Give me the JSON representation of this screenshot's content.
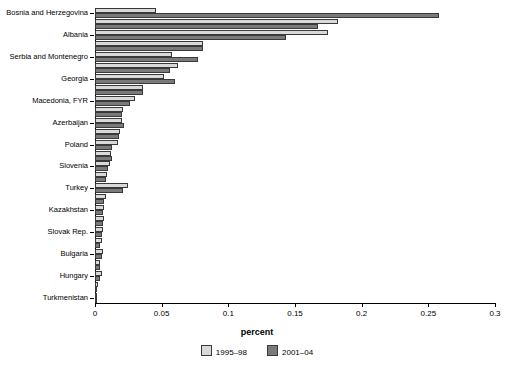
{
  "chart_data": {
    "type": "bar",
    "orientation": "horizontal",
    "title": "",
    "xlabel": "percent",
    "ylabel": "",
    "xlim": [
      0,
      0.3
    ],
    "xticks": [
      0,
      0.05,
      0.1,
      0.15,
      0.2,
      0.25,
      0.3
    ],
    "xticklabels": [
      "0",
      "0.05",
      "0.1",
      "0.15",
      "0.2",
      "0.25",
      "0.3"
    ],
    "grid": false,
    "legend_position": "bottom",
    "categories": [
      "Turkmenistan",
      "Uzbekistan",
      "Hungary",
      "Romania",
      "Bulgaria",
      "Czech Rep.",
      "Slovak Rep.",
      "Ukraine",
      "Kazakhstan",
      "Russia",
      "Turkey",
      "Croatia",
      "Slovenia",
      "Lithuania",
      "Poland",
      "Latvia",
      "Azerbaijan",
      "Estonia",
      "Macedonia, FYR",
      "Moldova",
      "Georgia",
      "Armenia",
      "Serbia and Montenegro",
      "Kyrgyz Rep.",
      "Albania",
      "Tajikistan",
      "Bosnia and Herzegovina"
    ],
    "series": [
      {
        "name": "1995–98",
        "color": "#d9d9d9",
        "values": [
          0.0005,
          0.002,
          0.005,
          0.004,
          0.006,
          0.005,
          0.006,
          0.007,
          0.007,
          0.008,
          0.025,
          0.009,
          0.011,
          0.012,
          0.017,
          0.019,
          0.02,
          0.021,
          0.03,
          0.036,
          0.052,
          0.062,
          0.058,
          0.081,
          0.175,
          0.182,
          0.046
        ]
      },
      {
        "name": "2001–04",
        "color": "#7a7a7a",
        "values": [
          0.0004,
          0.0015,
          0.004,
          0.004,
          0.005,
          0.004,
          0.005,
          0.006,
          0.006,
          0.007,
          0.021,
          0.008,
          0.01,
          0.013,
          0.013,
          0.018,
          0.022,
          0.02,
          0.026,
          0.036,
          0.06,
          0.056,
          0.077,
          0.081,
          0.143,
          0.167,
          0.258
        ]
      }
    ],
    "legend_entries": [
      "1995–98",
      "2001–04"
    ],
    "visible_category_labels": [
      "Turkmenistan",
      "Hungary",
      "Bulgaria",
      "Slovak Rep.",
      "Kazakhstan",
      "Turkey",
      "Slovenia",
      "Poland",
      "Azerbaijan",
      "Macedonia, FYR",
      "Georgia",
      "Serbia and Montenegro",
      "Albania",
      "Bosnia and Herzegovina"
    ]
  },
  "footnote": ""
}
